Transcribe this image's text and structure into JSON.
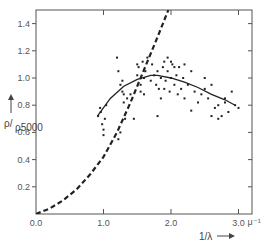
{
  "chart_data": {
    "type": "scatter",
    "title": "",
    "xlabel": "1/λ →",
    "xunit": "μ⁻¹",
    "ylabel": "ρ/ρ5000 →",
    "xlim": [
      0.0,
      3.2
    ],
    "ylim": [
      0.0,
      1.5
    ],
    "grid": false,
    "legend": null,
    "x_ticks": [
      {
        "value": 0.0,
        "label": "0.0"
      },
      {
        "value": 1.0,
        "label": "1.0"
      },
      {
        "value": 2.0,
        "label": "2.0"
      },
      {
        "value": 3.0,
        "label": "3.0"
      }
    ],
    "y_ticks": [
      {
        "value": 0.0,
        "label": ""
      },
      {
        "value": 0.2,
        "label": "0.2"
      },
      {
        "value": 0.4,
        "label": "0.4"
      },
      {
        "value": 0.6,
        "label": "0.6"
      },
      {
        "value": 0.8,
        "label": "0.8"
      },
      {
        "value": 1.0,
        "label": "1.0"
      },
      {
        "value": 1.2,
        "label": "1.2"
      },
      {
        "value": 1.4,
        "label": "1.4"
      }
    ],
    "series": [
      {
        "name": "observed points",
        "style": "scatter",
        "x": [
          0.92,
          0.95,
          0.98,
          1.0,
          1.02,
          0.96,
          1.0,
          1.04,
          1.2,
          1.22,
          1.25,
          1.28,
          1.3,
          1.25,
          1.22,
          1.3,
          1.32,
          1.35,
          1.28,
          1.5,
          1.52,
          1.55,
          1.58,
          1.6,
          1.55,
          1.5,
          1.6,
          1.62,
          1.65,
          1.7,
          1.72,
          1.75,
          1.78,
          1.8,
          1.82,
          1.85,
          1.88,
          1.9,
          1.92,
          1.95,
          1.98,
          2.0,
          2.02,
          2.05,
          2.08,
          2.1,
          2.12,
          2.15,
          2.18,
          2.2,
          2.25,
          2.3,
          2.35,
          2.4,
          2.45,
          2.5,
          2.55,
          2.6,
          2.65,
          2.7,
          2.75,
          2.8,
          2.85,
          2.9,
          2.95,
          3.0,
          2.5,
          2.6,
          2.7,
          2.8,
          1.8,
          1.85,
          1.9,
          1.95,
          2.0,
          2.05,
          1.4,
          1.45,
          2.2,
          2.3
        ],
        "y": [
          0.72,
          0.78,
          0.66,
          0.62,
          0.7,
          0.75,
          0.58,
          0.8,
          1.15,
          1.05,
          0.95,
          0.9,
          0.88,
          0.6,
          0.55,
          0.82,
          0.7,
          0.85,
          0.98,
          1.02,
          1.08,
          0.95,
          1.12,
          1.0,
          0.9,
          1.1,
          0.88,
          1.05,
          1.15,
          0.98,
          1.1,
          1.02,
          0.95,
          1.05,
          0.92,
          1.0,
          1.08,
          1.12,
          0.98,
          1.05,
          0.9,
          1.0,
          1.1,
          0.95,
          1.02,
          0.88,
          1.08,
          0.92,
          1.0,
          0.85,
          0.95,
          1.05,
          0.9,
          0.82,
          0.88,
          0.92,
          0.85,
          0.95,
          0.78,
          0.8,
          0.72,
          0.85,
          0.75,
          0.9,
          0.8,
          0.78,
          1.0,
          0.72,
          0.7,
          0.82,
          0.72,
          0.85,
          0.92,
          1.15,
          1.12,
          1.08,
          0.88,
          0.7,
          1.1,
          0.76
        ]
      },
      {
        "name": "fitted curve",
        "style": "solid-line",
        "x": [
          0.91,
          1.1,
          1.3,
          1.5,
          1.7,
          1.8,
          2.0,
          2.2,
          2.4,
          2.6,
          2.8,
          2.95
        ],
        "y": [
          0.72,
          0.85,
          0.94,
          0.99,
          1.02,
          1.02,
          1.0,
          0.97,
          0.93,
          0.88,
          0.84,
          0.8
        ]
      },
      {
        "name": "theoretical curve",
        "style": "dashed-line",
        "x": [
          0.0,
          0.2,
          0.4,
          0.6,
          0.8,
          1.0,
          1.2,
          1.4,
          1.6,
          1.8,
          1.96
        ],
        "y": [
          0.0,
          0.04,
          0.1,
          0.18,
          0.29,
          0.42,
          0.6,
          0.82,
          1.06,
          1.3,
          1.5
        ]
      }
    ]
  }
}
